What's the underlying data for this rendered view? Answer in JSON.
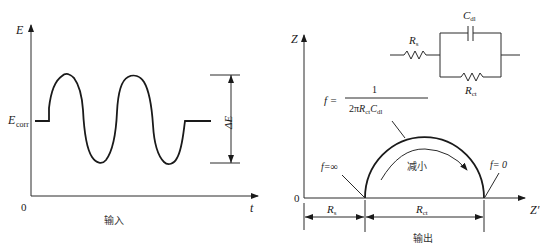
{
  "colors": {
    "stroke": "#1a1a1a",
    "background": "#ffffff"
  },
  "input_panel": {
    "y_axis_label": "E",
    "x_axis_label": "t",
    "origin_label": "0",
    "baseline_label_main": "E",
    "baseline_label_sub": "corr",
    "amplitude_label": "ΔE",
    "caption": "输入"
  },
  "output_panel": {
    "y_axis_label": "Z",
    "x_axis_label": "Z′",
    "origin_label": "0",
    "high_freq_label": "f=∞",
    "low_freq_label": "f= 0",
    "arrow_label": "减小",
    "formula": {
      "lhs": "f =",
      "numerator": "1",
      "denominator_prefix": "2π",
      "denominator_r": "R",
      "denominator_r_sub": "ct",
      "denominator_c": "C",
      "denominator_c_sub": "dl"
    },
    "dim_rs_main": "R",
    "dim_rs_sub": "s",
    "dim_rct_main": "R",
    "dim_rct_sub": "ct",
    "caption": "输出"
  },
  "circuit": {
    "rs_main": "R",
    "rs_sub": "s",
    "cdl_main": "C",
    "cdl_sub": "dl",
    "rct_main": "R",
    "rct_sub": "ct"
  }
}
